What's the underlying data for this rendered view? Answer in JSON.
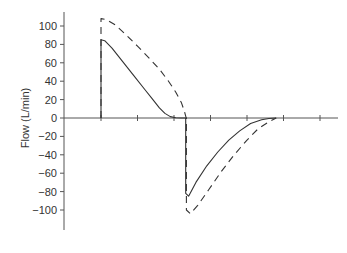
{
  "chart_data": {
    "type": "line",
    "title": "",
    "xlabel": "",
    "ylabel": "Flow (L/min)",
    "ylim": [
      -120,
      120
    ],
    "yticks": [
      100,
      80,
      60,
      40,
      20,
      0,
      -20,
      -40,
      -60,
      -80,
      -100
    ],
    "ytick_labels": [
      "100",
      "80",
      "60",
      "40",
      "20",
      "0",
      "−20",
      "−40",
      "−60",
      "−80",
      "−100"
    ],
    "xlim": [
      -1,
      6.5
    ],
    "xticks": [
      0,
      1,
      2,
      3,
      4,
      5,
      6
    ],
    "xtick_labels": [],
    "grid": false,
    "legend": "none",
    "series": [
      {
        "name": "solid",
        "style": "solid",
        "color": "#333333",
        "points": [
          [
            0,
            0
          ],
          [
            0,
            85
          ],
          [
            0.1,
            84
          ],
          [
            0.3,
            76
          ],
          [
            0.6,
            61
          ],
          [
            0.9,
            46
          ],
          [
            1.2,
            31
          ],
          [
            1.4,
            21
          ],
          [
            1.6,
            11
          ],
          [
            1.75,
            5
          ],
          [
            1.9,
            1.5
          ],
          [
            2.05,
            0.3
          ],
          [
            2.2,
            0
          ],
          [
            2.32,
            0
          ],
          [
            2.32,
            -82
          ],
          [
            2.4,
            -85
          ],
          [
            2.6,
            -70
          ],
          [
            2.9,
            -52
          ],
          [
            3.2,
            -37
          ],
          [
            3.5,
            -24
          ],
          [
            3.8,
            -14
          ],
          [
            4.1,
            -6
          ],
          [
            4.4,
            -2
          ],
          [
            4.6,
            -0.5
          ],
          [
            4.8,
            0
          ]
        ]
      },
      {
        "name": "dashed",
        "style": "dashed",
        "color": "#333333",
        "points": [
          [
            0,
            0
          ],
          [
            0,
            108
          ],
          [
            0.15,
            107
          ],
          [
            0.4,
            101
          ],
          [
            0.7,
            90
          ],
          [
            1.0,
            78
          ],
          [
            1.3,
            66
          ],
          [
            1.6,
            53
          ],
          [
            1.85,
            40
          ],
          [
            2.05,
            28
          ],
          [
            2.2,
            17
          ],
          [
            2.28,
            8
          ],
          [
            2.32,
            2
          ],
          [
            2.34,
            0
          ],
          [
            2.34,
            -100
          ],
          [
            2.45,
            -104
          ],
          [
            2.65,
            -95
          ],
          [
            2.95,
            -78
          ],
          [
            3.3,
            -58
          ],
          [
            3.65,
            -40
          ],
          [
            4.0,
            -24
          ],
          [
            4.3,
            -12
          ],
          [
            4.6,
            -4
          ],
          [
            4.8,
            0
          ]
        ]
      }
    ]
  }
}
